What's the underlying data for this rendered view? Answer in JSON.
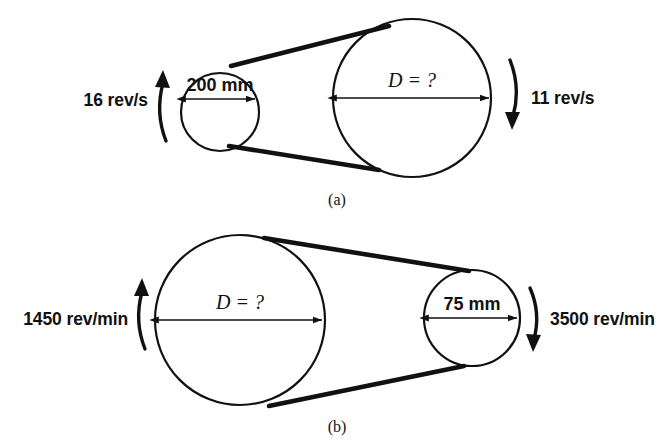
{
  "figure": {
    "background_color": "#ffffff",
    "line_color": "#111111"
  },
  "diagrams": [
    {
      "id": "a",
      "caption": "(a)",
      "driver_pulley": {
        "position": "left",
        "size": "small",
        "diameter_label": "200 mm",
        "speed_label": "16 rev/s",
        "rotation_direction": "up"
      },
      "driven_pulley": {
        "position": "right",
        "size": "large",
        "diameter_label": "D = ?",
        "speed_label": "11 rev/s",
        "rotation_direction": "down"
      }
    },
    {
      "id": "b",
      "caption": "(b)",
      "driver_pulley": {
        "position": "left",
        "size": "large",
        "diameter_label": "D = ?",
        "speed_label": "1450 rev/min",
        "rotation_direction": "up"
      },
      "driven_pulley": {
        "position": "right",
        "size": "small",
        "diameter_label": "75 mm",
        "speed_label": "3500 rev/min",
        "rotation_direction": "down"
      }
    }
  ]
}
